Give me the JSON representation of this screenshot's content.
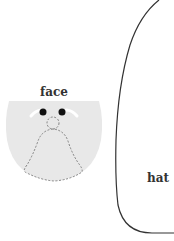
{
  "diagram": {
    "labels": {
      "face": "face",
      "hat": "hat"
    },
    "colors": {
      "face_fill": "#e8e8e8",
      "eye": "#111111",
      "brow": "#ffffff",
      "dashed_outline": "#777777",
      "hat_outline": "#333333",
      "label_text": "#333333"
    },
    "parts": [
      {
        "id": "face",
        "shape": "half-disc",
        "style": "filled light gray"
      },
      {
        "id": "left-eye",
        "shape": "dot"
      },
      {
        "id": "right-eye",
        "shape": "dot"
      },
      {
        "id": "left-eyebrow",
        "shape": "white stroke"
      },
      {
        "id": "right-eyebrow",
        "shape": "white stroke"
      },
      {
        "id": "nose-head",
        "shape": "dashed circle"
      },
      {
        "id": "body-bell",
        "shape": "dashed bell"
      },
      {
        "id": "hat",
        "shape": "rounded outline curve"
      }
    ]
  }
}
